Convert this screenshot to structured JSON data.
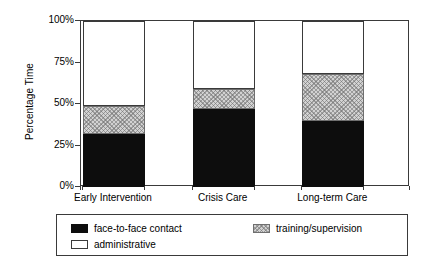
{
  "chart_data": {
    "type": "bar",
    "subtype": "stacked-100-percent",
    "title": "",
    "xlabel": "",
    "ylabel": "Percentage Time",
    "ylim": [
      0,
      100
    ],
    "yticks": [
      "0%",
      "25%",
      "50%",
      "75%",
      "100%"
    ],
    "ytick_values": [
      0,
      25,
      50,
      75,
      100
    ],
    "grid": false,
    "legend_position": "bottom",
    "categories": [
      "Early Intervention",
      "Crisis Care",
      "Long-term Care"
    ],
    "series": [
      {
        "name": "face-to-face contact",
        "color": "#0d0d0d",
        "fill": "solid",
        "values": [
          32,
          47,
          40
        ]
      },
      {
        "name": "training/supervision",
        "color": "#d2d2d2",
        "fill": "crosshatch",
        "values": [
          17,
          12,
          28
        ]
      },
      {
        "name": "administrative",
        "color": "#ffffff",
        "fill": "empty",
        "values": [
          51,
          41,
          32
        ]
      }
    ],
    "cumulative_tops": [
      {
        "category": "Early Intervention",
        "face_to_face_top": 32,
        "training_top": 49,
        "administrative_top": 100
      },
      {
        "category": "Crisis Care",
        "face_to_face_top": 47,
        "training_top": 59,
        "administrative_top": 100
      },
      {
        "category": "Long-term Care",
        "face_to_face_top": 40,
        "training_top": 68,
        "administrative_top": 100
      }
    ]
  },
  "legend": {
    "items": [
      {
        "label": "face-to-face contact",
        "swatch": "black-solid-swatch"
      },
      {
        "label": "training/supervision",
        "swatch": "gray-hatched-swatch"
      },
      {
        "label": "administrative",
        "swatch": "white-empty-swatch"
      }
    ]
  },
  "colors": {
    "black_series": "#0d0d0d",
    "gray_series": "#d2d2d2",
    "white_series": "#ffffff",
    "axis": "#3a3a3a",
    "background": "#ffffff"
  }
}
